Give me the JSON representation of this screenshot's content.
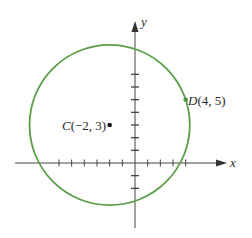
{
  "figure": {
    "axes": {
      "x_label": "x",
      "y_label": "y",
      "origin_px": [
        135,
        163
      ],
      "unit_px": 12.67,
      "x_ticks": [
        -6,
        -5,
        -4,
        -3,
        -2,
        -1,
        1,
        2,
        3,
        4
      ],
      "y_ticks": [
        -2,
        -1,
        1,
        2,
        3,
        4,
        5,
        6,
        7
      ]
    },
    "circle": {
      "center": [
        -2,
        3
      ],
      "radius_units": 6.3246,
      "stroke_color": "#5a9e48"
    },
    "points": [
      {
        "name": "C",
        "coords": "(−2, 3)",
        "x": -2,
        "y": 3,
        "color": "#1a1a1a"
      },
      {
        "name": "D",
        "coords": "(4, 5)",
        "x": 4,
        "y": 5,
        "color": "#4f9a3e"
      }
    ],
    "labels": {
      "C_name": "C",
      "C_coords": "(−2, 3)",
      "D_name": "D",
      "D_coords": "(4, 5)"
    },
    "colors": {
      "axis": "#444444",
      "circle": "#5a9e48",
      "text": "#2a2a2a"
    }
  }
}
